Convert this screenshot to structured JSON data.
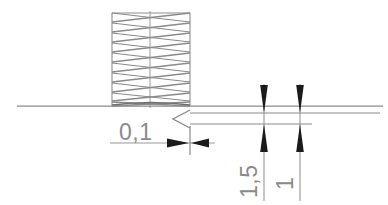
{
  "drawing": {
    "title": "Technical drawing - coil spring end detail with dimensions",
    "background_color": "#ffffff",
    "line_color": "#7d7d7d",
    "dark_line_color": "#555555",
    "arrow_color": "#1a1a1a",
    "text_color": "#8a8a8a",
    "baseline": {
      "name": "horizontal-axis-line",
      "y": 106,
      "x_start": 17,
      "x_end": 383
    },
    "spring": {
      "name": "coil-spring",
      "x_left": 112,
      "x_right": 190,
      "y_top": 12,
      "y_bottom": 106,
      "centerline_x": 150,
      "coil_count": 10
    },
    "surface_symbol": {
      "name": "surface-finish-triangle",
      "apex_x": 173,
      "base_x": 190,
      "center_y": 119,
      "half_height": 9
    },
    "dimensions": [
      {
        "id": "dim-0-1",
        "label": "0,1",
        "orientation": "horizontal",
        "text_x": 119,
        "text_y": 138,
        "line_y": 143,
        "line_x_start": 110,
        "line_x_end": 215,
        "tick_x": 190,
        "arrow_direction": "outward"
      },
      {
        "id": "dim-1-5",
        "label": "1,5",
        "orientation": "vertical-rotated",
        "text_x": 257,
        "text_y": 196,
        "extension_x": 264,
        "ext_y_top": 84,
        "ext_y_bottom": 200,
        "arrow_y_top": 113,
        "arrow_y_bottom": 124,
        "arrow_direction": "inward"
      },
      {
        "id": "dim-1",
        "label": "1",
        "orientation": "vertical-rotated",
        "text_x": 293,
        "text_y": 188,
        "extension_x": 300,
        "ext_y_top": 84,
        "ext_y_bottom": 200,
        "arrow_y_top": 113,
        "arrow_y_bottom": 124,
        "arrow_direction": "inward"
      }
    ],
    "leader_lines": [
      {
        "id": "leader-upper",
        "y": 113,
        "x_start": 190,
        "x_end": 380
      },
      {
        "id": "leader-lower",
        "y": 124,
        "x_start": 190,
        "x_end": 312
      }
    ]
  },
  "labels": {
    "gap_value": "0,1",
    "pitch_value": "1,5",
    "wire_value": "1"
  }
}
